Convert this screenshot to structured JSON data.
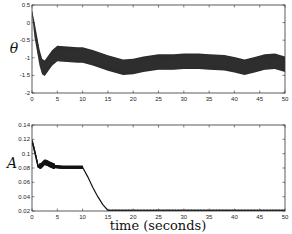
{
  "chart_data": [
    {
      "type": "line",
      "title": "",
      "xlabel": "",
      "ylabel": "θ",
      "xlim": [
        0,
        50
      ],
      "ylim": [
        -2,
        0.5
      ],
      "xticks": [
        "0",
        "5",
        "10",
        "15",
        "20",
        "25",
        "30",
        "35",
        "40",
        "45",
        "50"
      ],
      "yticks": [
        "-2",
        "-1.5",
        "-1",
        "-0.5",
        "0",
        "0.5"
      ],
      "grid": false,
      "series": [
        {
          "name": "theta (band center)",
          "x": [
            0,
            0.5,
            1,
            1.5,
            2,
            2.5,
            3,
            4,
            5,
            7,
            9,
            10,
            12,
            15,
            18,
            20,
            22,
            25,
            28,
            30,
            33,
            35,
            38,
            40,
            42,
            44,
            46,
            48,
            50
          ],
          "values": [
            0.3,
            -0.2,
            -0.6,
            -1.0,
            -1.25,
            -1.3,
            -1.2,
            -1.0,
            -0.88,
            -0.9,
            -0.92,
            -0.92,
            -1.0,
            -1.15,
            -1.27,
            -1.25,
            -1.18,
            -1.12,
            -1.12,
            -1.1,
            -1.1,
            -1.12,
            -1.14,
            -1.2,
            -1.27,
            -1.2,
            -1.12,
            -1.1,
            -1.18
          ],
          "band_halfwidth": 0.22
        }
      ]
    },
    {
      "type": "line",
      "title": "",
      "xlabel": "time (seconds)",
      "ylabel": "A",
      "xlim": [
        0,
        50
      ],
      "ylim": [
        0.02,
        0.14
      ],
      "xticks": [
        "0",
        "5",
        "10",
        "15",
        "20",
        "25",
        "30",
        "35",
        "40",
        "45",
        "50"
      ],
      "yticks": [
        "0.02",
        "0.04",
        "0.06",
        "0.08",
        "0.1",
        "0.12",
        "0.14"
      ],
      "grid": false,
      "series": [
        {
          "name": "A",
          "x": [
            0,
            0.3,
            0.8,
            1.2,
            1.8,
            2.5,
            3,
            3.5,
            4.5,
            6,
            8,
            10,
            11,
            12,
            13,
            14,
            15,
            20,
            30,
            40,
            50
          ],
          "values": [
            0.118,
            0.11,
            0.095,
            0.082,
            0.083,
            0.088,
            0.087,
            0.085,
            0.082,
            0.081,
            0.081,
            0.081,
            0.068,
            0.053,
            0.04,
            0.029,
            0.021,
            0.021,
            0.021,
            0.021,
            0.021
          ]
        }
      ]
    }
  ],
  "labels": {
    "top_ylabel": "θ",
    "bottom_ylabel": "A",
    "xlabel": "time (seconds)"
  }
}
